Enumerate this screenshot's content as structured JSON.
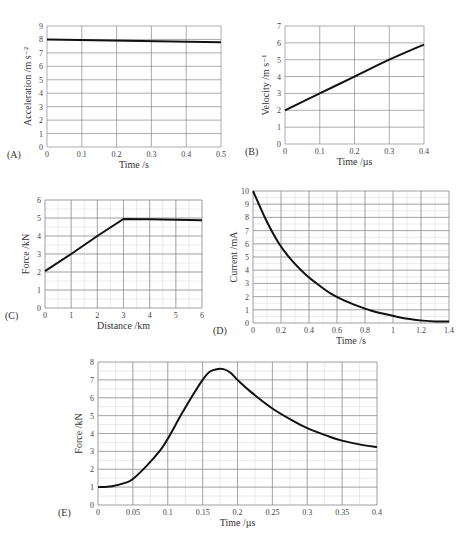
{
  "chart_data": [
    {
      "panel": "(A)",
      "type": "line",
      "title": "",
      "xlabel": "Time /s",
      "ylabel": "Acceleration /m s⁻²",
      "xlim": [
        0,
        0.5
      ],
      "ylim": [
        0,
        9
      ],
      "xticks": [
        "0",
        "0.1",
        "0.2",
        "0.3",
        "0.4",
        "0.5"
      ],
      "yticks": [
        "0",
        "1",
        "2",
        "3",
        "4",
        "5",
        "6",
        "7",
        "8",
        "9"
      ],
      "grid": true,
      "minor_grid": false,
      "series": [
        {
          "name": "acceleration",
          "x": [
            0,
            0.5
          ],
          "y": [
            8.0,
            7.8
          ]
        }
      ],
      "box": {
        "x0": 47,
        "x1": 221,
        "y0": 26,
        "y1": 147
      },
      "yminor": 1,
      "xminor": 1
    },
    {
      "panel": "(B)",
      "type": "line",
      "title": "",
      "xlabel": "Time /µs",
      "ylabel": "Velocity /m s⁻¹",
      "xlim": [
        0,
        0.4
      ],
      "ylim": [
        0,
        7
      ],
      "xticks": [
        "0",
        "0.1",
        "0.2",
        "0.3",
        "0.4"
      ],
      "yticks": [
        "0",
        "1",
        "2",
        "3",
        "4",
        "5",
        "6",
        "7"
      ],
      "grid": true,
      "minor_grid": false,
      "series": [
        {
          "name": "velocity",
          "x": [
            0,
            0.1,
            0.2,
            0.3,
            0.4
          ],
          "y": [
            2,
            3,
            4,
            5,
            5.9
          ]
        }
      ],
      "box": {
        "x0": 285,
        "x1": 424,
        "y0": 26,
        "y1": 144
      },
      "yminor": 1,
      "xminor": 1
    },
    {
      "panel": "(C)",
      "type": "line",
      "title": "",
      "xlabel": "Distance /km",
      "ylabel": "Force /kN",
      "xlim": [
        0,
        6
      ],
      "ylim": [
        0,
        6
      ],
      "xticks": [
        "0",
        "1",
        "2",
        "3",
        "4",
        "5",
        "6"
      ],
      "yticks": [
        "0",
        "1",
        "2",
        "3",
        "4",
        "5",
        "6"
      ],
      "grid": true,
      "minor_grid": true,
      "series": [
        {
          "name": "force",
          "x": [
            0,
            1,
            2,
            3,
            4,
            5,
            6
          ],
          "y": [
            2.05,
            3,
            4,
            4.95,
            4.93,
            4.9,
            4.88
          ]
        }
      ],
      "box": {
        "x0": 45,
        "x1": 202,
        "y0": 200,
        "y1": 308
      },
      "yminor": 2,
      "xminor": 2
    },
    {
      "panel": "(D)",
      "type": "line",
      "title": "",
      "xlabel": "Time /s",
      "ylabel": "Current /mA",
      "xlim": [
        0,
        1.5
      ],
      "ylim": [
        0,
        10
      ],
      "xticks": [
        "0",
        "0.2",
        "0.4",
        "0.6",
        "0.8",
        "1",
        "1.2",
        "1.4"
      ],
      "yticks": [
        "0",
        "1",
        "2",
        "3",
        "4",
        "5",
        "6",
        "7",
        "8",
        "9",
        "10"
      ],
      "grid": true,
      "minor_grid": true,
      "series": [
        {
          "name": "current",
          "x": [
            0,
            0.1,
            0.2,
            0.3,
            0.4,
            0.5,
            0.6,
            0.7,
            0.8,
            0.9,
            1.0,
            1.1,
            1.2,
            1.3,
            1.4,
            1.5
          ],
          "y": [
            10,
            7.8,
            6.0,
            4.7,
            3.7,
            2.9,
            2.2,
            1.7,
            1.3,
            0.95,
            0.7,
            0.48,
            0.3,
            0.18,
            0.12,
            0.12
          ]
        }
      ],
      "box": {
        "x0": 253,
        "x1": 449,
        "y0": 191,
        "y1": 323
      },
      "yminor": 2,
      "xminor": 2
    },
    {
      "panel": "(E)",
      "type": "line",
      "title": "",
      "xlabel": "Time /µs",
      "ylabel": "Force /kN",
      "xlim": [
        0,
        0.4
      ],
      "ylim": [
        0,
        8
      ],
      "xticks": [
        "0",
        "0.05",
        "0.1",
        "0.15",
        "0.2",
        "0.25",
        "0.3",
        "0.35",
        "0.4"
      ],
      "yticks": [
        "0",
        "1",
        "2",
        "3",
        "4",
        "5",
        "6",
        "7",
        "8"
      ],
      "grid": true,
      "minor_grid": true,
      "series": [
        {
          "name": "force",
          "x": [
            0,
            0.02,
            0.04,
            0.05,
            0.07,
            0.09,
            0.1,
            0.12,
            0.14,
            0.15,
            0.16,
            0.17,
            0.18,
            0.19,
            0.2,
            0.22,
            0.25,
            0.28,
            0.3,
            0.33,
            0.35,
            0.38,
            0.4
          ],
          "y": [
            1.0,
            1.05,
            1.25,
            1.45,
            2.2,
            3.1,
            3.7,
            5.1,
            6.4,
            7.0,
            7.45,
            7.6,
            7.6,
            7.4,
            7.0,
            6.3,
            5.4,
            4.7,
            4.3,
            3.85,
            3.6,
            3.35,
            3.25
          ]
        }
      ],
      "box": {
        "x0": 98,
        "x1": 377,
        "y0": 362,
        "y1": 505
      },
      "yminor": 2,
      "xminor": 2
    }
  ]
}
